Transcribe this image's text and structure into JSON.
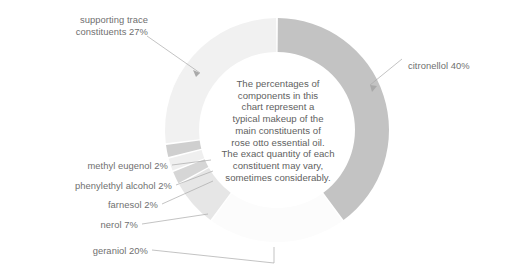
{
  "chart_data": {
    "type": "pie",
    "variant": "donut",
    "title": "",
    "subtitle": "",
    "xlabel": "",
    "ylabel": "",
    "legend_position": "callout-labels",
    "grid": false,
    "units": "percent",
    "start_angle_deg": 0,
    "direction": "clockwise",
    "categories": [
      "citronellol",
      "geraniol",
      "nerol",
      "farnesol",
      "phenylethyl alcohol",
      "methyl eugenol",
      "supporting trace constituents"
    ],
    "values": [
      40,
      20,
      7,
      2,
      2,
      2,
      27
    ],
    "total": 100,
    "slices": [
      {
        "label": "citronellol 40%",
        "name": "citronellol",
        "value": 40,
        "color": "#c3c3c3"
      },
      {
        "label": "geraniol 20%",
        "name": "geraniol",
        "value": 20,
        "color": "#fcfcfc"
      },
      {
        "label": "nerol 7%",
        "name": "nerol",
        "value": 7,
        "color": "#e6e6e6"
      },
      {
        "label": "farnesol 2%",
        "name": "farnesol",
        "value": 2,
        "color": "#d6d6d6"
      },
      {
        "label": "phenylethyl alcohol 2%",
        "name": "phenylethyl alcohol",
        "value": 2,
        "color": "#efefef"
      },
      {
        "label": "methyl eugenol 2%",
        "name": "methyl eugenol",
        "value": 2,
        "color": "#cfcfcf"
      },
      {
        "label": "supporting trace constituents 27%",
        "name": "supporting trace constituents",
        "value": 27,
        "color": "#f1f1f1"
      }
    ],
    "annotations": [
      "The percentages of components in this chart represent a typical makeup of the main constituents of rose otto essential oil. The exact quantity of each constituent may vary, sometimes considerably."
    ]
  },
  "labels": {
    "supporting_trace": "supporting trace\nconstituents 27%",
    "citronellol": "citronellol 40%",
    "methyl_eugenol": "methyl eugenol 2%",
    "phenylethyl_alcohol": "phenylethyl alcohol 2%",
    "farnesol": "farnesol 2%",
    "nerol": "nerol 7%",
    "geraniol": "geraniol 20%"
  },
  "center_note": "The percentages of\ncomponents in this\nchart represent a\ntypical makeup of the\nmain constituents of\nrose otto essential oil.\nThe exact quantity of each\nconstituent may vary,\nsometimes considerably.",
  "colors": {
    "background": "#ffffff",
    "text": "#6f6f6f",
    "center_text": "#5f5f5f",
    "leader_line": "#a9a9a9",
    "slice_dark": "#c3c3c3",
    "slice_light": "#f1f1f1"
  },
  "geometry": {
    "center_x": 277,
    "center_y": 130,
    "outer_radius": 112,
    "inner_radius": 78
  }
}
